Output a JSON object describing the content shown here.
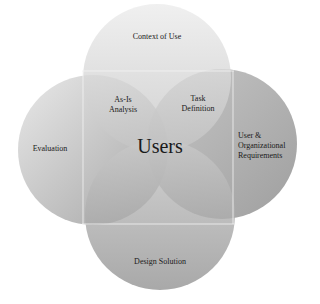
{
  "diagram": {
    "type": "venn",
    "center_label": "Users",
    "circles": [
      {
        "id": "top",
        "label": "Context of Use"
      },
      {
        "id": "left",
        "label": "Evaluation"
      },
      {
        "id": "right",
        "label": "User & Organizational Requirements"
      },
      {
        "id": "bottom",
        "label": "Design Solution"
      }
    ],
    "intersections": [
      {
        "between": [
          "top",
          "left"
        ],
        "label": "As-Is Analysis"
      },
      {
        "between": [
          "top",
          "right"
        ],
        "label": "Task Definition"
      }
    ]
  },
  "labels": {
    "context": "Context of Use",
    "evaluation": "Evaluation",
    "requirements_1": "User &",
    "requirements_2": "Organizational",
    "requirements_3": "Requirements",
    "design": "Design Solution",
    "asis_1": "As-Is",
    "asis_2": "Analysis",
    "task_1": "Task",
    "task_2": "Definition",
    "users": "Users"
  }
}
